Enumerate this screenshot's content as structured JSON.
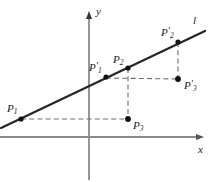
{
  "figure": {
    "width": 211,
    "height": 182,
    "background": "#ffffff"
  },
  "colors": {
    "axis": "#8a8a8a",
    "line": "#262626",
    "dashed": "#6e6e6e",
    "point": "#111111",
    "text": "#1a1a1a"
  },
  "axes": {
    "x": {
      "label": "x",
      "label_x": 198,
      "label_y": 144,
      "y_position": 137,
      "x_start": 0,
      "x_end": 204
    },
    "y": {
      "label": "y",
      "label_x": 96,
      "label_y": 6,
      "x_position": 89,
      "y_start": 12,
      "y_end": 180
    }
  },
  "line": {
    "name": "l",
    "label": "l",
    "label_x": 193,
    "label_y": 15,
    "x1": 1,
    "y1": 128,
    "x2": 205,
    "y2": 31
  },
  "points": [
    {
      "id": "P1",
      "base": "P",
      "sub": "1",
      "prime": "",
      "x": 21,
      "y": 119,
      "label_x": 7,
      "label_y": 99
    },
    {
      "id": "P1p",
      "base": "P",
      "sub": "1",
      "prime": "'",
      "x": 106,
      "y": 77,
      "label_x": 89,
      "label_y": 58
    },
    {
      "id": "P2",
      "base": "P",
      "sub": "2",
      "prime": "",
      "x": 128,
      "y": 68,
      "label_x": 113,
      "label_y": 50
    },
    {
      "id": "P2p",
      "base": "P",
      "sub": "2",
      "prime": "'",
      "x": 178,
      "y": 42,
      "label_x": 161,
      "label_y": 23
    },
    {
      "id": "P3",
      "base": "P",
      "sub": "3",
      "prime": "",
      "x": 128,
      "y": 119,
      "label_x": 133,
      "label_y": 116
    },
    {
      "id": "P3p",
      "base": "P",
      "sub": "3",
      "prime": "'",
      "x": 178,
      "y": 79,
      "label_x": 184,
      "label_y": 76
    }
  ],
  "dashed_segments": [
    {
      "id": "P1-to-P3",
      "x1": 21,
      "y1": 119,
      "x2": 128,
      "y2": 119
    },
    {
      "id": "P2-to-P3",
      "x1": 128,
      "y1": 68,
      "x2": 128,
      "y2": 119
    },
    {
      "id": "P1p-to-P3p",
      "x1": 106,
      "y1": 78,
      "x2": 178,
      "y2": 79
    },
    {
      "id": "P2p-to-P3p",
      "x1": 178,
      "y1": 42,
      "x2": 178,
      "y2": 79
    }
  ]
}
